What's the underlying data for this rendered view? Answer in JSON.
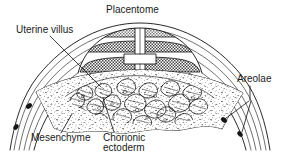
{
  "figure": {
    "title": "Placentome",
    "type": "anatomical-cross-section",
    "width": 281,
    "height": 153,
    "background_color": "#ffffff",
    "ink_color": "#111111"
  },
  "labels": {
    "placentome": "Placentome",
    "uterine_villus": "Uterine villus",
    "areolae": "Areolae",
    "mesenchyme": "Mesenchyme",
    "chorionic_ectoderm_line1": "Chorionic",
    "chorionic_ectoderm_line2": "ectoderm"
  },
  "label_positions": {
    "placentome": {
      "x": 106,
      "y": 13,
      "anchor": "start"
    },
    "uterine_villus": {
      "x": 16,
      "y": 33,
      "anchor": "start"
    },
    "areolae": {
      "x": 237,
      "y": 82,
      "anchor": "start"
    },
    "mesenchyme": {
      "x": 31,
      "y": 141,
      "anchor": "start"
    },
    "chorionic_ectoderm_line1": {
      "x": 103,
      "y": 141,
      "anchor": "start"
    },
    "chorionic_ectoderm_line2": {
      "x": 103,
      "y": 151,
      "anchor": "start"
    }
  },
  "leaders": [
    {
      "name": "uterine-villus-leader",
      "d": "M 50 36 L 101 87"
    },
    {
      "name": "areolae-leader-top",
      "d": "M 250 86 L 250 100"
    },
    {
      "name": "areolae-leader-a",
      "d": "M 248 101 L 224 120"
    },
    {
      "name": "areolae-leader-b",
      "d": "M 250 101 L 243 133"
    },
    {
      "name": "mesenchyme-leader",
      "d": "M 61 133 L 72 115"
    },
    {
      "name": "chorionic-ectoderm-leader",
      "d": "M 114 132 L 103 98"
    }
  ],
  "structures": {
    "uterine_layers": {
      "name": "uterine-wall-layers",
      "count": 5,
      "description": "concentric arcing lines forming the uterine wall"
    },
    "placentome_dome": {
      "name": "placentome-dome",
      "band_count": 3,
      "band_fill": "#8a8a8a",
      "description": "hatched dome bands with white cruciform septum"
    },
    "chorionic_plate": {
      "name": "chorionic-plate",
      "fill": "#ffffff",
      "stipple": true,
      "description": "stippled mesenchyme bed beneath the villi"
    },
    "villi_mass": {
      "name": "villi-mass",
      "description": "dense branching chorionic villi interdigitating with uterine caruncle"
    },
    "areolae_marks": {
      "name": "areolae-marks",
      "count": 4,
      "fill": "#161616"
    }
  },
  "colors": {
    "ink": "#111111",
    "band_gray": "#8a8a8a",
    "band_gray_light": "#b5b5b5",
    "paper": "#ffffff",
    "areola": "#161616"
  }
}
